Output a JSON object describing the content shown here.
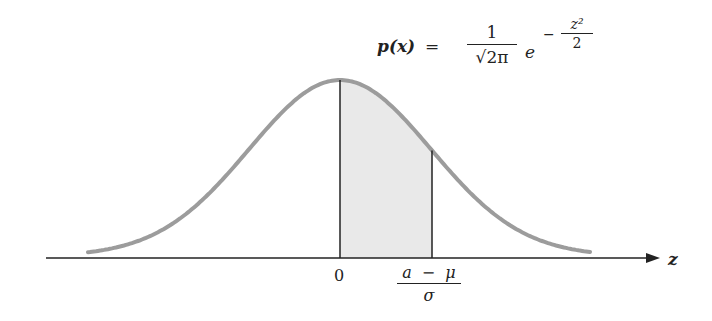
{
  "diagram": {
    "formula": {
      "lhs": "p(x)",
      "equals": "=",
      "numerator": "1",
      "denominator": "√2π",
      "base": "e",
      "exponent_sign": "−",
      "exponent_numerator": "z²",
      "exponent_denominator": "2"
    },
    "axis": {
      "label": "z",
      "ticks": [
        {
          "label": "0"
        },
        {
          "label_numerator": [
            "a",
            "−",
            "μ"
          ],
          "label_denominator": "σ"
        }
      ]
    },
    "colors": {
      "curve": "#9a9a9a",
      "shade": "#e8e8e8",
      "axis": "#222222"
    }
  },
  "chart_data": {
    "type": "area",
    "xlabel": "z",
    "ylabel": "",
    "curve": "standard normal density",
    "x": [
      -2.77,
      -2,
      -1,
      0,
      1,
      2,
      2.75
    ],
    "values": [
      0.009,
      0.054,
      0.242,
      0.399,
      0.242,
      0.054,
      0.009
    ],
    "shaded_region": {
      "from": 0,
      "to": "(a − μ)/σ",
      "approx_to": 1.0
    },
    "tick_labels": [
      "0",
      "(a − μ)/σ"
    ],
    "grid": false,
    "legend": null
  }
}
